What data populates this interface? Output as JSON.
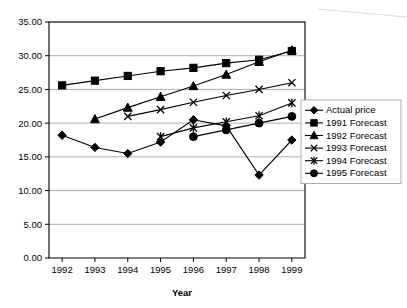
{
  "chart_data": {
    "type": "line",
    "title": "",
    "subtitle": "",
    "xlabel": "Year",
    "ylabel": "",
    "x": [
      1992,
      1993,
      1994,
      1995,
      1996,
      1997,
      1998,
      1999
    ],
    "xtick_labels": [
      "1992",
      "1993",
      "1994",
      "1995",
      "1996",
      "1997",
      "1998",
      "1999"
    ],
    "ytick_labels": [
      "0.00",
      "5.00",
      "10.00",
      "15.00",
      "20.00",
      "25.00",
      "30.00",
      "35.00"
    ],
    "ytick_values": [
      0,
      5,
      10,
      15,
      20,
      25,
      30,
      35
    ],
    "ylim": [
      0,
      35
    ],
    "xlim": [
      1991.6,
      1999.4
    ],
    "grid": "horizontal",
    "legend_position": "right",
    "line_color": "#000000",
    "grid_color": "#9b9b9b",
    "series": [
      {
        "name": "Actual price",
        "marker": "diamond",
        "x": [
          1992,
          1993,
          1994,
          1995,
          1996,
          1997,
          1998,
          1999
        ],
        "values": [
          18.2,
          16.4,
          15.5,
          17.2,
          20.5,
          19.6,
          12.3,
          17.5
        ]
      },
      {
        "name": "1991 Forecast",
        "marker": "square",
        "x": [
          1992,
          1993,
          1994,
          1995,
          1996,
          1997,
          1998,
          1999
        ],
        "values": [
          25.6,
          26.3,
          27.0,
          27.7,
          28.2,
          28.9,
          29.4,
          30.7
        ]
      },
      {
        "name": "1992 Forecast",
        "marker": "triangle",
        "x": [
          1993,
          1994,
          1995,
          1996,
          1997,
          1998,
          1999
        ],
        "values": [
          20.6,
          22.3,
          23.9,
          25.5,
          27.2,
          29.1,
          30.8
        ]
      },
      {
        "name": "1993 Forecast",
        "marker": "x",
        "x": [
          1994,
          1995,
          1996,
          1997,
          1998,
          1999
        ],
        "values": [
          21.0,
          22.0,
          23.1,
          24.1,
          25.0,
          26.0
        ]
      },
      {
        "name": "1994 Forecast",
        "marker": "asterisk",
        "x": [
          1995,
          1996,
          1997,
          1998,
          1999
        ],
        "values": [
          18.0,
          19.3,
          20.2,
          21.1,
          23.0
        ]
      },
      {
        "name": "1995 Forecast",
        "marker": "circle",
        "x": [
          1996,
          1997,
          1998,
          1999
        ],
        "values": [
          18.0,
          19.0,
          20.0,
          21.0
        ]
      }
    ]
  },
  "legend": {
    "entries": [
      {
        "label": "Actual price",
        "marker": "diamond"
      },
      {
        "label": "1991 Forecast",
        "marker": "square"
      },
      {
        "label": "1992 Forecast",
        "marker": "triangle"
      },
      {
        "label": "1993 Forecast",
        "marker": "x"
      },
      {
        "label": "1994 Forecast",
        "marker": "asterisk"
      },
      {
        "label": "1995 Forecast",
        "marker": "circle"
      }
    ]
  }
}
